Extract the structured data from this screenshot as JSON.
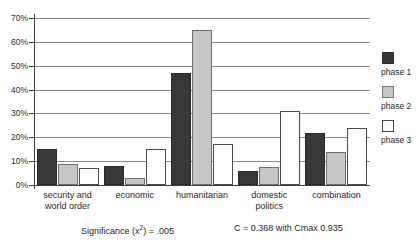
{
  "chart_data": {
    "type": "bar",
    "title": "",
    "subtitle": "",
    "xlabel": "",
    "ylabel": "",
    "ylim": [
      0,
      70
    ],
    "y_tick_step": 10,
    "grid": true,
    "grid_axis": "y",
    "legend_position": "right",
    "y_ticks": [
      "0%",
      "10%",
      "20%",
      "30%",
      "40%",
      "50%",
      "60%",
      "70%"
    ],
    "y_tick_values": [
      0,
      10,
      20,
      30,
      40,
      50,
      60,
      70
    ],
    "categories": [
      "security and world order",
      "economic",
      "humanitarian",
      "domestic politics",
      "combination"
    ],
    "category_lines": [
      [
        "security and",
        "world order"
      ],
      [
        "economic",
        ""
      ],
      [
        "humanitarian",
        ""
      ],
      [
        "domestic",
        "politics"
      ],
      [
        "combination",
        ""
      ]
    ],
    "series": [
      {
        "name": "phase 1",
        "color": "#383838",
        "values": [
          15,
          8,
          47,
          6,
          22
        ]
      },
      {
        "name": "phase 2",
        "color": "#c6c6c6",
        "values": [
          9,
          3,
          65,
          7.5,
          14
        ]
      },
      {
        "name": "phase 3",
        "color": "#ffffff",
        "values": [
          7,
          15,
          17,
          31,
          24
        ]
      }
    ],
    "annotations": [
      "Significance (x2) = .005",
      "C = 0.368 with Cmax 0.935"
    ]
  },
  "legend": {
    "items": [
      {
        "label": "phase 1",
        "swatch": "dark-swatch"
      },
      {
        "label": "phase 2",
        "swatch": "gray-swatch"
      },
      {
        "label": "phase 3",
        "swatch": "white-swatch"
      }
    ]
  },
  "footer": {
    "significance_prefix": "Significance (x",
    "significance_exponent": "2",
    "significance_suffix": ") = .005",
    "significance_full": "Significance (x²) = .005",
    "contingency": "C = 0.368 with Cmax 0.935"
  },
  "colors": {
    "phase1": "#383838",
    "phase2": "#c6c6c6",
    "phase3": "#ffffff",
    "gridline": "#8a8a8a",
    "axis": "#3d3d3d",
    "text": "#1f1f1f",
    "background": "#ffffff"
  }
}
